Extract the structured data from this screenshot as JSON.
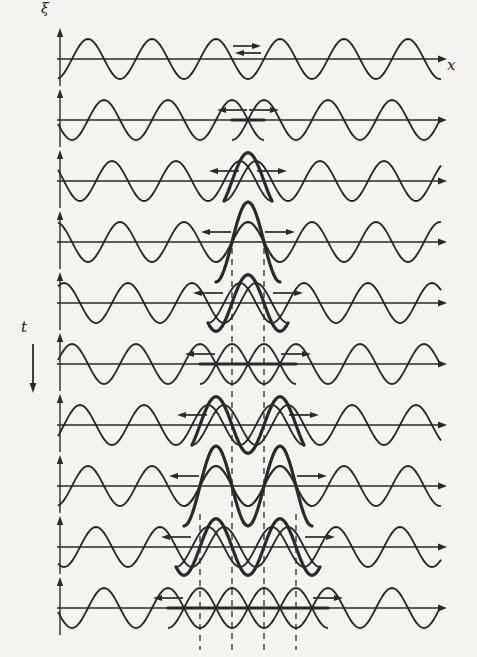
{
  "figure": {
    "background_color": "#f4f3ef",
    "ink_color": "#2a2a2a",
    "labels": {
      "displacement_axis": "ξ",
      "position_axis": "x",
      "time_axis": "t"
    },
    "geometry": {
      "width": 477,
      "height": 657,
      "axis_x_start": 57,
      "axis_x_end": 441,
      "axis_head_x": 447,
      "vaxis_x": 60,
      "wave": {
        "amplitude": 20,
        "wavelength": 64,
        "phase_x0": 72,
        "center_x": 248,
        "sample_step": 2
      }
    },
    "rows": [
      {
        "axis_y": 59,
        "shift": 0,
        "overlap": 0,
        "arrows": [
          {
            "x1": 233,
            "x2": 261,
            "dy": -13
          },
          {
            "x1": 261,
            "x2": 235,
            "dy": -6
          }
        ]
      },
      {
        "axis_y": 120,
        "shift": 16,
        "overlap": 16,
        "arrows": [
          {
            "x1": 247,
            "x2": 217,
            "dy": -10
          },
          {
            "x1": 249,
            "x2": 279,
            "dy": -10
          }
        ]
      },
      {
        "axis_y": 181,
        "shift": 24,
        "overlap": 24,
        "arrows": [
          {
            "x1": 239,
            "x2": 209,
            "dy": -10
          },
          {
            "x1": 257,
            "x2": 287,
            "dy": -10
          }
        ]
      },
      {
        "axis_y": 242,
        "shift": 32,
        "overlap": 32,
        "arrows": [
          {
            "x1": 231,
            "x2": 201,
            "dy": -10
          },
          {
            "x1": 265,
            "x2": 295,
            "dy": -10
          }
        ]
      },
      {
        "axis_y": 303,
        "shift": 40,
        "overlap": 40,
        "arrows": [
          {
            "x1": 223,
            "x2": 193,
            "dy": -10
          },
          {
            "x1": 273,
            "x2": 303,
            "dy": -10
          }
        ]
      },
      {
        "axis_y": 364,
        "shift": 48,
        "overlap": 48,
        "arrows": [
          {
            "x1": 215,
            "x2": 185,
            "dy": -10
          },
          {
            "x1": 281,
            "x2": 311,
            "dy": -10
          }
        ]
      },
      {
        "axis_y": 425,
        "shift": 56,
        "overlap": 56,
        "arrows": [
          {
            "x1": 207,
            "x2": 177,
            "dy": -10
          },
          {
            "x1": 289,
            "x2": 319,
            "dy": -10
          }
        ]
      },
      {
        "axis_y": 486,
        "shift": 64,
        "overlap": 64,
        "arrows": [
          {
            "x1": 199,
            "x2": 169,
            "dy": -10
          },
          {
            "x1": 297,
            "x2": 327,
            "dy": -10
          }
        ]
      },
      {
        "axis_y": 547,
        "shift": 72,
        "overlap": 72,
        "arrows": [
          {
            "x1": 191,
            "x2": 161,
            "dy": -10
          },
          {
            "x1": 305,
            "x2": 335,
            "dy": -10
          }
        ]
      },
      {
        "axis_y": 608,
        "shift": 80,
        "overlap": 80,
        "arrows": [
          {
            "x1": 183,
            "x2": 153,
            "dy": -10
          },
          {
            "x1": 313,
            "x2": 343,
            "dy": -10
          }
        ]
      }
    ],
    "dashed_guides": [
      {
        "x": 232,
        "y1": 248,
        "y2": 650
      },
      {
        "x": 264,
        "y1": 248,
        "y2": 650
      },
      {
        "x": 200,
        "y1": 514,
        "y2": 650
      },
      {
        "x": 296,
        "y1": 514,
        "y2": 650
      }
    ],
    "time_arrow": {
      "x": 33,
      "y1": 344,
      "y2": 393
    },
    "line_widths": {
      "axis": 1.4,
      "wave": 1.9,
      "resultant": 3.2,
      "dashed": 1.3,
      "arrow": 1.7
    }
  }
}
